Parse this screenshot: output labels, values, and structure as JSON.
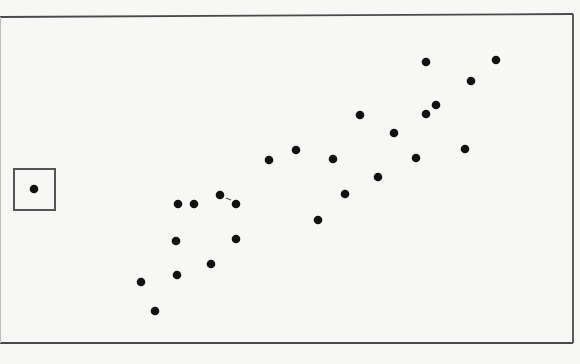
{
  "chart_data": {
    "type": "scatter",
    "title": "",
    "xlabel": "",
    "ylabel": "",
    "grid": false,
    "legend": null,
    "axes_ticks": "none",
    "pixel_frame": {
      "left": 0,
      "top_left_y": 17,
      "top_right_y": 14,
      "right": 573,
      "bottom": 343
    },
    "points_px": [
      {
        "x": 141,
        "y": 282
      },
      {
        "x": 155,
        "y": 311
      },
      {
        "x": 176,
        "y": 241
      },
      {
        "x": 177,
        "y": 275
      },
      {
        "x": 178,
        "y": 204
      },
      {
        "x": 194,
        "y": 204
      },
      {
        "x": 211,
        "y": 264
      },
      {
        "x": 220,
        "y": 195
      },
      {
        "x": 236,
        "y": 204
      },
      {
        "x": 236,
        "y": 239
      },
      {
        "x": 269,
        "y": 160
      },
      {
        "x": 296,
        "y": 150
      },
      {
        "x": 318,
        "y": 220
      },
      {
        "x": 333,
        "y": 159
      },
      {
        "x": 345,
        "y": 194
      },
      {
        "x": 360,
        "y": 115
      },
      {
        "x": 378,
        "y": 177
      },
      {
        "x": 394,
        "y": 133
      },
      {
        "x": 416,
        "y": 158
      },
      {
        "x": 426,
        "y": 114
      },
      {
        "x": 426,
        "y": 62
      },
      {
        "x": 436,
        "y": 105
      },
      {
        "x": 465,
        "y": 149
      },
      {
        "x": 471,
        "y": 81
      },
      {
        "x": 496,
        "y": 60
      }
    ],
    "outlier_px": {
      "x": 34,
      "y": 189,
      "boxed": true,
      "box": {
        "x": 14,
        "y": 169,
        "w": 41,
        "h": 41
      }
    },
    "annotations": [
      {
        "type": "tick-mark",
        "x1": 226,
        "y1": 198,
        "x2": 231,
        "y2": 200
      }
    ],
    "colors": {
      "background": "#f7f7f6",
      "frame": "#4a4a4a",
      "point": "#111111",
      "box": "#555555"
    },
    "point_radius": 4.3
  }
}
